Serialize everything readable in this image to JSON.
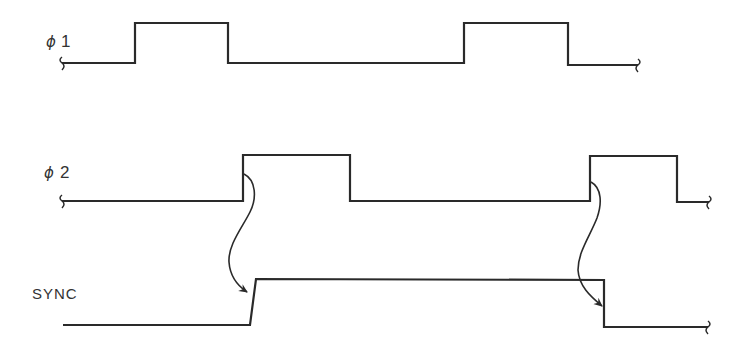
{
  "diagram": {
    "type": "timing-diagram",
    "signals": [
      {
        "id": "phi1",
        "label_symbol": "ϕ",
        "label_number": "1",
        "low_y": 63,
        "high_y": 23,
        "start_x": 62,
        "end_x": 638,
        "pulses": [
          [
            135,
            228
          ],
          [
            464,
            568
          ]
        ]
      },
      {
        "id": "phi2",
        "label_symbol": "ϕ",
        "label_number": "2",
        "low_y": 201,
        "high_y": 155,
        "start_x": 62,
        "end_x": 711,
        "pulses": [
          [
            243,
            350
          ],
          [
            590,
            677
          ]
        ]
      },
      {
        "id": "sync",
        "label": "SYNC",
        "low_y": 325,
        "high_y": 279,
        "start_x": 63,
        "end_x": 710,
        "rise_x": [
          250,
          256
        ],
        "fall_x": 604
      }
    ],
    "causal_arrows": [
      {
        "from": "phi2 rising edge 1",
        "to": "SYNC rising edge"
      },
      {
        "from": "phi2 rising edge 2",
        "to": "SYNC falling edge"
      }
    ]
  }
}
